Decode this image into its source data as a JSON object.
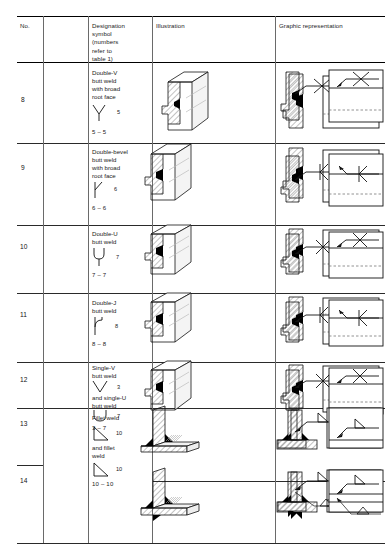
{
  "table": {
    "headers": [
      {
        "key": "no",
        "label": "No."
      },
      {
        "key": "designation",
        "label": "Designation symbol (numbers refer to table 1)",
        "lines": [
          "Designation",
          "symbol",
          "(numbers",
          "refer to",
          "table 1)"
        ]
      },
      {
        "key": "illustration",
        "label": "Illustration"
      },
      {
        "key": "graphic",
        "label": "Graphic representation"
      },
      {
        "key": "symbolic",
        "label": "Symbolic representation"
      }
    ],
    "rows": [
      {
        "no": "8",
        "name_lines": [
          "Double-V",
          "butt weld",
          "with broad",
          "root face"
        ],
        "symbols": [
          {
            "glyph": "double-v-symbol",
            "number": "5"
          }
        ],
        "pair": "5 – 5",
        "weld_symbol": "x-symbol",
        "joint": "butt",
        "graphic_fill": "double-v",
        "second_symbol": false
      },
      {
        "no": "9",
        "name_lines": [
          "Double-bevel",
          "butt weld",
          "with broad",
          "root face"
        ],
        "symbols": [
          {
            "glyph": "double-bevel-symbol",
            "number": "6"
          }
        ],
        "pair": "6 – 6",
        "weld_symbol": "k-symbol",
        "joint": "butt",
        "graphic_fill": "double-bevel",
        "second_symbol": false
      },
      {
        "no": "10",
        "name_lines": [
          "Double-U",
          "butt weld"
        ],
        "symbols": [
          {
            "glyph": "double-u-symbol",
            "number": "7"
          }
        ],
        "pair": "7 – 7",
        "weld_symbol": "x-symbol",
        "joint": "butt",
        "graphic_fill": "double-u",
        "second_symbol": false
      },
      {
        "no": "11",
        "name_lines": [
          "Double-J",
          "butt weld"
        ],
        "symbols": [
          {
            "glyph": "double-j-symbol",
            "number": "8"
          }
        ],
        "pair": "8 – 8",
        "weld_symbol": "k-symbol",
        "joint": "butt",
        "graphic_fill": "double-j",
        "second_symbol": false
      },
      {
        "no": "12",
        "name_lines": [
          "Single-V",
          "butt weld"
        ],
        "name_lines2": [
          "and single-U",
          "butt weld"
        ],
        "symbols": [
          {
            "glyph": "single-v-symbol",
            "number": "3"
          },
          {
            "glyph": "single-u-symbol",
            "number": "7"
          }
        ],
        "pair": "3 – 7",
        "weld_symbol": "x-symbol",
        "joint": "butt",
        "graphic_fill": "single-v-u",
        "second_symbol": false
      },
      {
        "no": "13",
        "name_lines": [
          "Fillet weld"
        ],
        "symbols": [
          {
            "glyph": "fillet-symbol",
            "number": "10"
          }
        ],
        "pair": "",
        "weld_symbol": "triangle-symbol",
        "joint": "tee",
        "graphic_fill": "fillet-single",
        "second_symbol": false
      },
      {
        "no": "14",
        "name_lines": [
          "and fillet",
          "weld"
        ],
        "symbols": [
          {
            "glyph": "fillet-symbol",
            "number": "10"
          }
        ],
        "pair": "10 – 10",
        "weld_symbol": "triangle-symbol",
        "joint": "tee",
        "graphic_fill": "fillet-double",
        "second_symbol": true
      }
    ]
  },
  "colors": {
    "rule": "#2a2a2a",
    "thin_rule": "#6a6a6a",
    "ink": "#111111",
    "hatch": "#333333",
    "weld_fill": "#000000",
    "paper": "#ffffff"
  }
}
